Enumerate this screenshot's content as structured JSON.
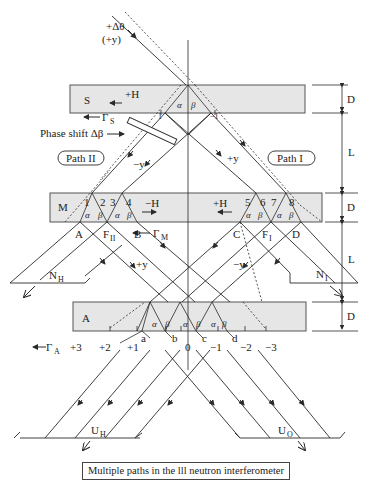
{
  "figure": {
    "caption": "Multiple paths in the lll neutron interferometer",
    "incident": {
      "label1": "+Δθ",
      "label2": "(+y)"
    },
    "crystals": {
      "S": {
        "label": "S",
        "field": "+H",
        "gamma": "Γ",
        "gamma_sub": "S"
      },
      "M": {
        "label": "M",
        "field_left": "−H",
        "field_right": "+H",
        "gamma": "Γ",
        "gamma_sub": "M"
      },
      "A": {
        "label": "A",
        "gamma": "Γ",
        "gamma_sub": "A"
      }
    },
    "phase_shift": "Phase shift Δβ",
    "paths": {
      "path1": "Path I",
      "path2": "Path II"
    },
    "dimensions": {
      "D": "D",
      "L": "L"
    },
    "beam_labels": {
      "minus_y": "−y",
      "plus_y": "+y",
      "A": "A",
      "B": "B",
      "C": "C",
      "D": "D",
      "F2": "F",
      "F2_sub": "II",
      "F1": "F",
      "F1_sub": "I",
      "NH": "N",
      "NH_sub": "H",
      "NI": "N",
      "NI_sub": "I",
      "UH": "U",
      "UH_sub": "H",
      "UO": "U",
      "UO_sub": "O"
    },
    "mirror_points": [
      "1",
      "2",
      "3",
      "4",
      "5",
      "6",
      "7",
      "8"
    ],
    "angles": {
      "alpha": "α",
      "beta": "β"
    },
    "s_markers": {
      "left": "1",
      "right": "−1"
    },
    "a_points": [
      "a",
      "b",
      "c",
      "d"
    ],
    "orders": [
      "+3",
      "+2",
      "+1",
      "0",
      "−1",
      "−2",
      "−3"
    ]
  },
  "colors": {
    "slab": "#e6e6e6",
    "line": "#2a2a2a",
    "background": "#ffffff"
  }
}
